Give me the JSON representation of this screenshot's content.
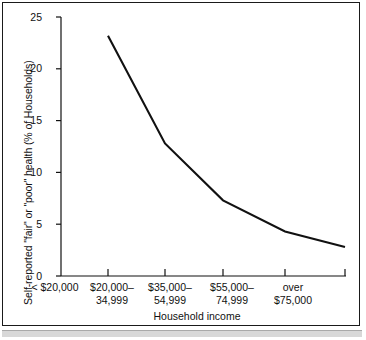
{
  "figure": {
    "background_color": "#ffffff",
    "frame_color": "#1a1a1a",
    "line_color": "#111111",
    "strip_color": "#d8d8d8"
  },
  "chart_data": {
    "type": "line",
    "title": "",
    "subtitle": "",
    "xlabel": "Household income",
    "ylabel": "Self-reported \"fair\" or \"poor\" health (% of Households)",
    "categories": [
      "< $20,000",
      "$20,000–\n34,999",
      "$35,000–\n54,999",
      "$55,000–\n74,999",
      "over\n$75,000"
    ],
    "values": [
      23.2,
      12.8,
      7.3,
      4.3,
      2.8
    ],
    "ylim": [
      0,
      25
    ],
    "yticks": [
      0,
      5,
      10,
      15,
      20,
      25
    ],
    "ytick_labels": [
      "0",
      "5",
      "10",
      "15",
      "20",
      "25"
    ],
    "grid": false,
    "legend": false,
    "legend_position": "none",
    "series": [
      {
        "name": "Self-reported \"fair\" or \"poor\" health",
        "values": [
          23.2,
          12.8,
          7.3,
          4.3,
          2.8
        ]
      }
    ]
  }
}
